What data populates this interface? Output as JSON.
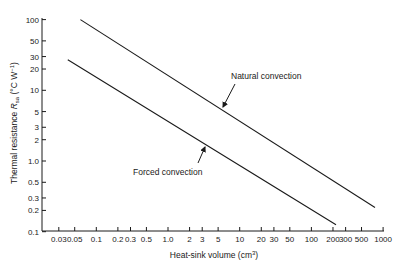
{
  "chart_data": {
    "type": "line",
    "title": "",
    "xlabel": "Heat-sink volume (cm³)",
    "xlabel_parts": {
      "main": "Heat-sink volume (cm",
      "sup": "3",
      "end": ")"
    },
    "ylabel": "Thermal resistance R_sa (°C W⁻¹)",
    "ylabel_parts": {
      "main": "Thermal resistance ",
      "sym": "R",
      "sub": "sa",
      "unit": " (°C W",
      "sup": "−1",
      "end": ")"
    },
    "xscale": "log",
    "yscale": "log",
    "xlim": [
      0.02,
      1000
    ],
    "ylim": [
      0.1,
      100
    ],
    "grid": false,
    "legend": "none (inline arrow annotations)",
    "x_ticks": [
      {
        "v": 0.03,
        "label": "0.03"
      },
      {
        "v": 0.05,
        "label": "0.05"
      },
      {
        "v": 0.1,
        "label": "0.1"
      },
      {
        "v": 0.2,
        "label": "0.2"
      },
      {
        "v": 0.3,
        "label": "0.3"
      },
      {
        "v": 0.5,
        "label": "0.5"
      },
      {
        "v": 1,
        "label": "1.0"
      },
      {
        "v": 2,
        "label": "2"
      },
      {
        "v": 3,
        "label": "3"
      },
      {
        "v": 5,
        "label": "5"
      },
      {
        "v": 10,
        "label": "10"
      },
      {
        "v": 20,
        "label": "20"
      },
      {
        "v": 30,
        "label": "30"
      },
      {
        "v": 50,
        "label": "50"
      },
      {
        "v": 100,
        "label": "100"
      },
      {
        "v": 200,
        "label": "200"
      },
      {
        "v": 300,
        "label": "300"
      },
      {
        "v": 500,
        "label": "500"
      },
      {
        "v": 1000,
        "label": "1000"
      }
    ],
    "y_ticks": [
      {
        "v": 100,
        "label": "100"
      },
      {
        "v": 50,
        "label": "50"
      },
      {
        "v": 30,
        "label": "30"
      },
      {
        "v": 20,
        "label": "20"
      },
      {
        "v": 10,
        "label": "10"
      },
      {
        "v": 5,
        "label": "5"
      },
      {
        "v": 3,
        "label": "3"
      },
      {
        "v": 2,
        "label": "2"
      },
      {
        "v": 1,
        "label": "1.0"
      },
      {
        "v": 0.5,
        "label": "0.5"
      },
      {
        "v": 0.3,
        "label": "0.3"
      },
      {
        "v": 0.2,
        "label": "0.2"
      },
      {
        "v": 0.1,
        "label": "0.1"
      }
    ],
    "series": [
      {
        "name": "Natural convection",
        "x": [
          0.06,
          770
        ],
        "y": [
          100,
          0.22
        ],
        "annotation": {
          "label": "Natural convection",
          "arrow_at": {
            "x": 4,
            "y": 6
          }
        }
      },
      {
        "name": "Forced convection",
        "x": [
          0.04,
          220
        ],
        "y": [
          27,
          0.125
        ],
        "annotation": {
          "label": "Forced convection",
          "arrow_at": {
            "x": 3.6,
            "y": 1.5
          }
        }
      }
    ]
  }
}
